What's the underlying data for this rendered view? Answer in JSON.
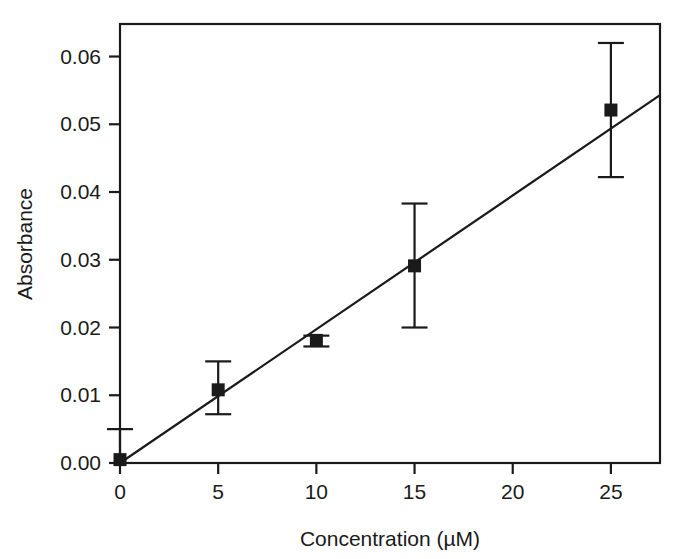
{
  "chart_data": {
    "type": "scatter",
    "title": "",
    "subtitle": "",
    "xlabel": "Concentration (µM)",
    "ylabel": "Absorbance",
    "xlim": [
      0,
      27.5
    ],
    "ylim": [
      0,
      0.0648
    ],
    "xticks": [
      0,
      5,
      10,
      15,
      20,
      25
    ],
    "xtick_labels": [
      "0",
      "5",
      "10",
      "15",
      "20",
      "25"
    ],
    "yticks": [
      0.0,
      0.01,
      0.02,
      0.03,
      0.04,
      0.05,
      0.06
    ],
    "ytick_labels": [
      "0.00",
      "0.01",
      "0.02",
      "0.03",
      "0.04",
      "0.05",
      "0.06"
    ],
    "grid": false,
    "legend": null,
    "frame": "box",
    "marker": {
      "shape": "square",
      "color": "#1a1a1a",
      "size_px": 13
    },
    "series": [
      {
        "name": "Absorbance vs Concentration",
        "x": [
          0,
          5,
          10,
          15,
          25
        ],
        "y": [
          0.0005,
          0.0108,
          0.0181,
          0.0291,
          0.0521
        ],
        "yerr_low": [
          0.0005,
          0.0036,
          0.0009,
          0.0091,
          0.0099
        ],
        "yerr_high": [
          0.0045,
          0.0042,
          0.0007,
          0.0092,
          0.0099
        ],
        "err_low": [
          0.0,
          0.0072,
          0.0172,
          0.02,
          0.0422
        ],
        "err_high": [
          0.005,
          0.015,
          0.0188,
          0.0383,
          0.062
        ]
      }
    ],
    "fit_line": {
      "type": "linear",
      "intercept": 0.0,
      "slope": 0.001975,
      "x_start": 0,
      "x_end": 27.5,
      "y_start": 0.0,
      "y_end": 0.0543,
      "color": "#1a1a1a"
    },
    "annotations": []
  },
  "axes": {
    "x_title": "Concentration (µM)",
    "y_title": "Absorbance"
  },
  "colors": {
    "ink": "#1a1a1a",
    "background": "#ffffff"
  }
}
